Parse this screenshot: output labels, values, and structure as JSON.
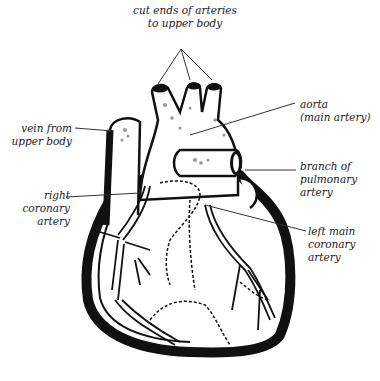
{
  "diagram": {
    "labels": {
      "cut_ends": "cut ends of arteries\nto upper body",
      "aorta": "aorta\n(main artery)",
      "vein": "vein from\nupper body",
      "pulmonary": "branch of\npulmonary\nartery",
      "right_coronary": "right\ncoronary\nartery",
      "left_coronary": "left main\ncoronary\nartery"
    },
    "colors": {
      "ink": "#111111",
      "background": "#ffffff",
      "leader_line": "#333333"
    }
  }
}
